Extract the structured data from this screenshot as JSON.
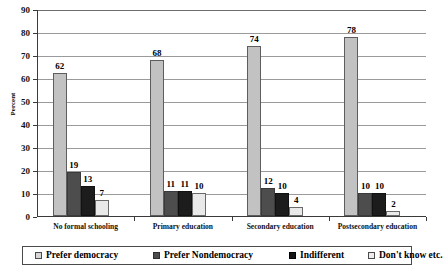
{
  "chart_data": {
    "type": "bar",
    "title": "",
    "xlabel": "",
    "ylabel": "Percent",
    "ylim": [
      0,
      90
    ],
    "ytick_step": 10,
    "yticks": [
      0,
      10,
      20,
      30,
      40,
      50,
      60,
      70,
      80,
      90
    ],
    "grid": true,
    "legend_position": "bottom",
    "categories": [
      "No formal schooling",
      "Primary education",
      "Secondary education",
      "Postsecondary education"
    ],
    "series": [
      {
        "name": "Prefer democracy",
        "color": "#c2c2c2",
        "values": [
          62,
          68,
          74,
          78
        ]
      },
      {
        "name": "Prefer Nondemocracy",
        "color": "#4d4d4d",
        "values": [
          19,
          11,
          12,
          10
        ]
      },
      {
        "name": "Indifferent",
        "color": "#1c1c1c",
        "values": [
          13,
          11,
          10,
          10
        ]
      },
      {
        "name": "Don't know etc.",
        "color": "#e9e9e9",
        "values": [
          7,
          10,
          4,
          2
        ]
      }
    ]
  },
  "axis": {
    "y_title": "Percent"
  }
}
